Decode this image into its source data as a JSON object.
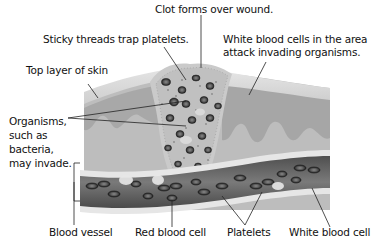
{
  "diagram": {
    "type": "labeled-illustration",
    "colors": {
      "background": "#ffffff",
      "top_skin": "#d9d9d9",
      "dermis": "#bdbdbd",
      "dermis_dark": "#a6a6a6",
      "clot": "#c4c4c4",
      "vessel_wall": "#e6e6e6",
      "vessel_inner": "#6e6e6e",
      "cell": "#3a3a3a",
      "line": "#222222"
    },
    "labels": {
      "clot": "Clot forms over wound.",
      "sticky": "Sticky threads trap platelets.",
      "white_area_1": "White blood cells in the area",
      "white_area_2": "attack invading organisms.",
      "top_layer": "Top layer of skin",
      "organisms": "Organisms,\nsuch as\nbacteria,\nmay invade.",
      "blood_vessel": "Blood vessel",
      "red_cell": "Red blood cell",
      "platelets": "Platelets",
      "white_cell": "White blood cell"
    }
  }
}
